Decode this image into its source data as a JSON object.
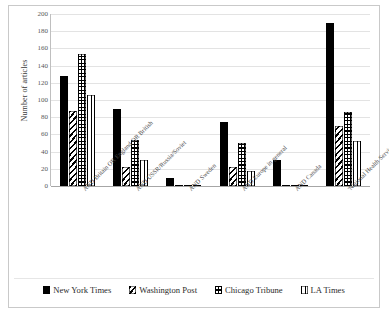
{
  "chart_data": {
    "type": "bar",
    "title": "",
    "subtitle": "",
    "xlabel": "",
    "ylabel": "Number of articles",
    "ylim": [
      0,
      200
    ],
    "ytick_step": 20,
    "yticks": [
      0,
      20,
      40,
      60,
      80,
      100,
      120,
      140,
      160,
      180,
      200
    ],
    "grid": true,
    "legend_position": "bottom",
    "orientation": "vertical",
    "categories": [
      "AND Britain OR England OR British",
      "AND USSR/Russia/Soviet",
      "AND Sweden",
      "AND Europe in general",
      "AND Canada",
      "'National Health Service'"
    ],
    "series": [
      {
        "name": "New York Times",
        "pattern": "solid-black",
        "values": [
          128,
          89,
          9,
          74,
          30,
          190
        ]
      },
      {
        "name": "Washington Post",
        "pattern": "diagonal-hatch",
        "values": [
          87,
          22,
          1,
          22,
          1,
          70
        ]
      },
      {
        "name": "Chicago Tribune",
        "pattern": "grid-crosshatch",
        "values": [
          153,
          54,
          1,
          50,
          1,
          86
        ]
      },
      {
        "name": "LA Times",
        "pattern": "vertical-lines",
        "values": [
          106,
          30,
          1,
          18,
          1,
          52
        ]
      }
    ]
  },
  "colors": {
    "ink": "#000000",
    "background": "#ffffff",
    "gridline": "#e3e3e3",
    "axis": "#a6a6a6",
    "frame": "#c9c9c9"
  }
}
